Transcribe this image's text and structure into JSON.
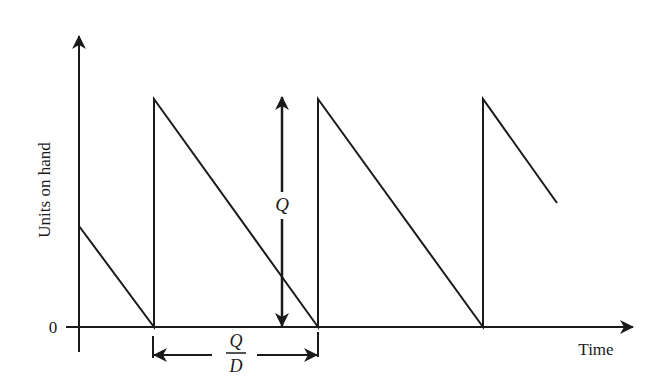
{
  "diagram": {
    "type": "inventory sawtooth (EOQ model)",
    "y_axis_label": "Units on hand",
    "x_axis_label": "Time",
    "origin_label": "0",
    "q_label": "Q",
    "cycle_numerator": "Q",
    "cycle_denominator": "D",
    "colors": {
      "line": "#1a1a1a",
      "background": "#ffffff"
    }
  }
}
